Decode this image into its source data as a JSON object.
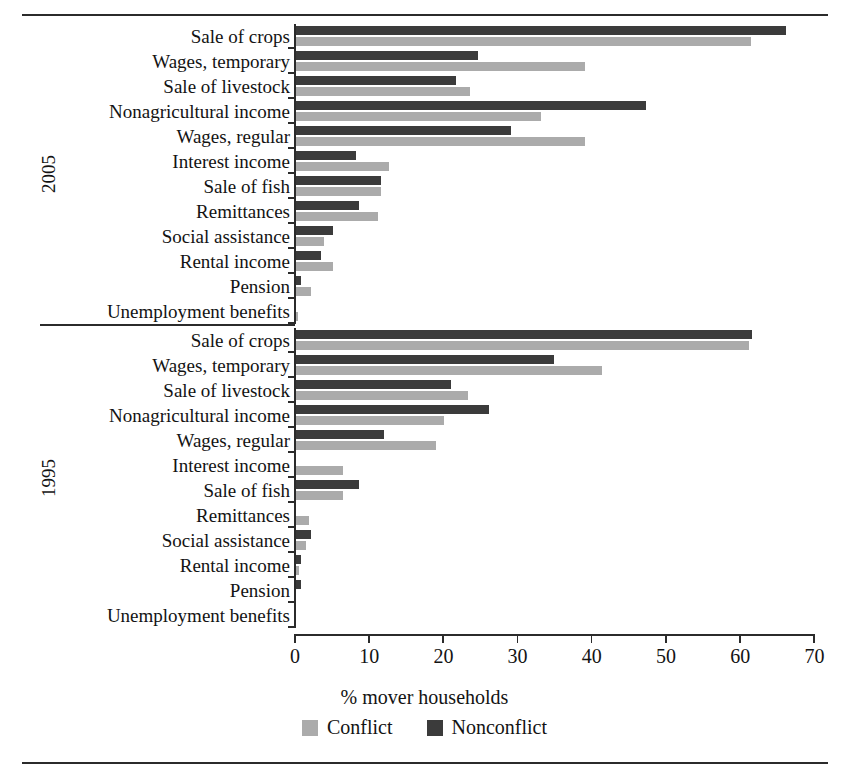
{
  "chart_data": {
    "type": "bar",
    "orientation": "horizontal",
    "title": "",
    "xlabel": "% mover households",
    "ylabel": "",
    "xlim": [
      0,
      70
    ],
    "xticks": [
      0,
      10,
      20,
      30,
      40,
      50,
      60,
      70
    ],
    "grid": false,
    "legend_position": "bottom-center",
    "legend": [
      "Conflict",
      "Nonconflict"
    ],
    "colors": {
      "conflict": "#ababab",
      "nonconflict": "#3b3b3b",
      "axis": "#2b2b2b",
      "text": "#131313"
    },
    "panels": [
      {
        "name": "2005",
        "categories": [
          "Sale of crops",
          "Wages, temporary",
          "Sale of livestock",
          "Nonagricultural income",
          "Wages, regular",
          "Interest income",
          "Sale of fish",
          "Remittances",
          "Social assistance",
          "Rental income",
          "Pension",
          "Unemployment benefits"
        ],
        "series": [
          {
            "name": "Nonconflict",
            "values": [
              66.0,
              24.5,
              21.5,
              47.2,
              29.0,
              8.1,
              11.4,
              8.5,
              5.0,
              3.4,
              0.7,
              0.0
            ]
          },
          {
            "name": "Conflict",
            "values": [
              61.3,
              39.0,
              23.4,
              33.0,
              39.0,
              12.5,
              11.4,
              11.0,
              3.8,
              5.0,
              2.0,
              0.3
            ]
          }
        ]
      },
      {
        "name": "1995",
        "categories": [
          "Sale of crops",
          "Wages, temporary",
          "Sale of livestock",
          "Nonagricultural income",
          "Wages, regular",
          "Interest income",
          "Sale of fish",
          "Remittances",
          "Social assistance",
          "Rental income",
          "Pension",
          "Unemployment benefits"
        ],
        "series": [
          {
            "name": "Nonconflict",
            "values": [
              61.5,
              34.8,
              20.9,
              26.0,
              11.9,
              0.0,
              8.5,
              0.0,
              2.0,
              0.7,
              0.7,
              0.0
            ]
          },
          {
            "name": "Conflict",
            "values": [
              61.0,
              41.2,
              23.2,
              20.0,
              18.9,
              6.3,
              6.3,
              1.7,
              1.4,
              0.4,
              0.0,
              0.0
            ]
          }
        ]
      }
    ]
  },
  "axis": {
    "xlabel": "% mover households",
    "tick_labels": [
      "0",
      "10",
      "20",
      "30",
      "40",
      "50",
      "60",
      "70"
    ]
  },
  "legend": {
    "conflict_label": "Conflict",
    "nonconflict_label": "Nonconflict"
  },
  "years": {
    "upper": "2005",
    "lower": "1995"
  }
}
